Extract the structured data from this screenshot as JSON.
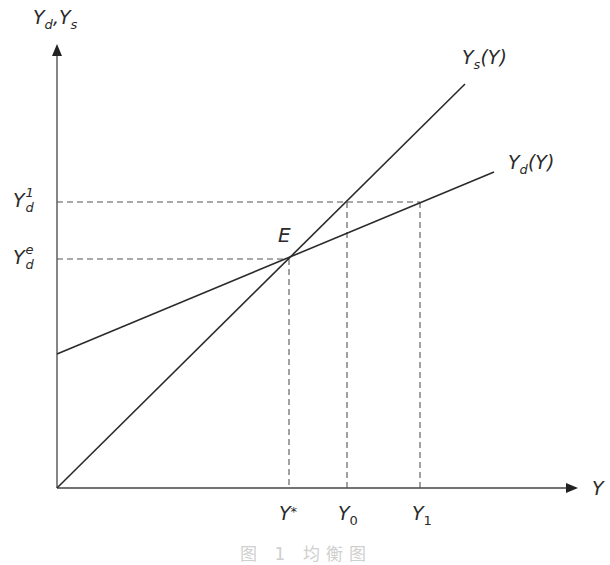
{
  "diagram": {
    "y_axis_label": {
      "main1": "Y",
      "sub1": "d",
      "sep": ",",
      "main2": "Y",
      "sub2": "s"
    },
    "x_axis_label": "Y",
    "curves": [
      {
        "name": "supply",
        "label_main": "Y",
        "label_sub": "s",
        "label_arg": "(Y)"
      },
      {
        "name": "demand",
        "label_main": "Y",
        "label_sub": "d",
        "label_arg": "(Y)"
      }
    ],
    "equilibrium_point": "E",
    "y_ticks": [
      {
        "main": "Y",
        "sup": "1",
        "sub": "d"
      },
      {
        "main": "Y",
        "sup": "e",
        "sub": "d"
      }
    ],
    "x_ticks": [
      {
        "main": "Y",
        "suffix": "*"
      },
      {
        "main": "Y",
        "sub": "0"
      },
      {
        "main": "Y",
        "sub": "1"
      }
    ],
    "caption": "图 1  均衡图",
    "colors": {
      "line": "#2b2b2b",
      "dash": "#555555",
      "axis": "#333333"
    }
  }
}
